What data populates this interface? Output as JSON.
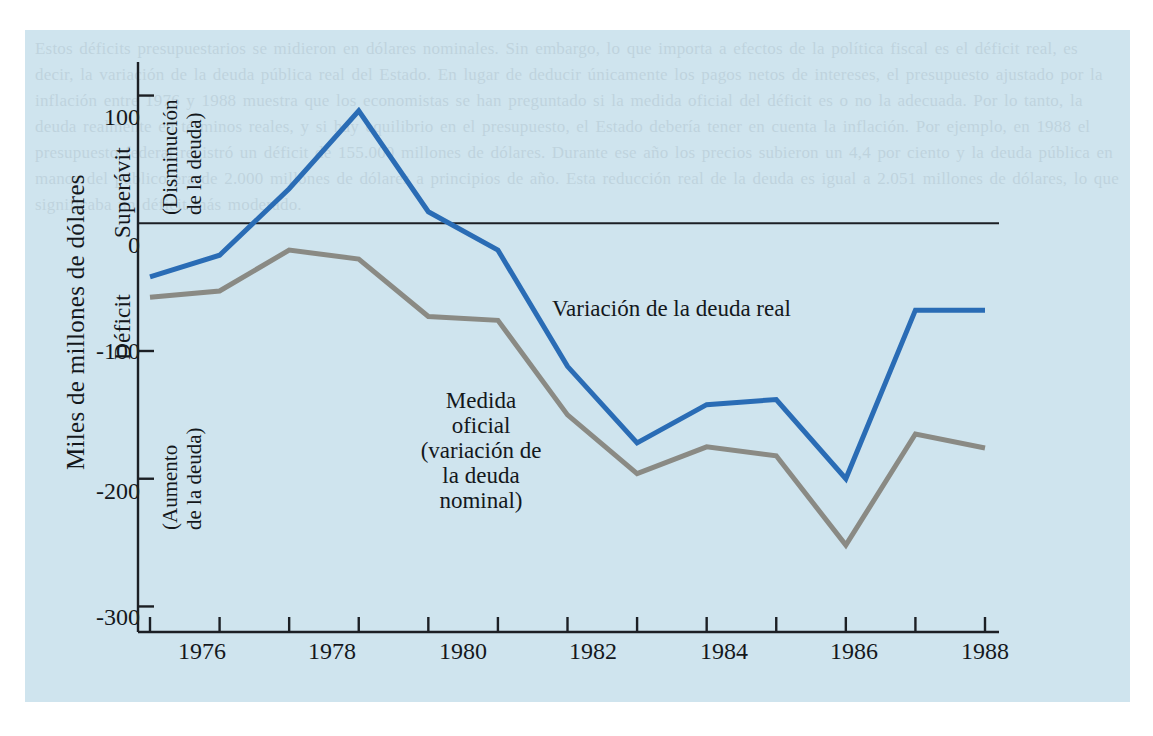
{
  "figure": {
    "background_color": "#ffffff",
    "panel_color": "#cfe4ee",
    "axis_color": "#1c1f24"
  },
  "axes": {
    "ylabel_main": "Miles de millones de dólares",
    "ylabel_positive_zone": "Superávit",
    "ylabel_negative_zone": "Déficit",
    "note_positive": "(Disminución\nde la deuda)",
    "note_positive_line1": "(Disminución",
    "note_positive_line2": "de la deuda)",
    "note_negative_line1": "(Aumento",
    "note_negative_line2": "de la deuda)",
    "ytick_labels": [
      "100",
      "0",
      "-100",
      "-200",
      "-300"
    ],
    "xtick_labels": [
      "1976",
      "1978",
      "1980",
      "1982",
      "1984",
      "1986",
      "1988"
    ]
  },
  "labels": {
    "series_real": "Variación de la deuda real",
    "series_official_line1": "Medida",
    "series_official_line2": "oficial",
    "series_official_line3": "(variación de",
    "series_official_line4": "la deuda",
    "series_official_line5": "nominal)"
  },
  "ghost_text": "Estos déficits presupuestarios se midieron en dólares nominales. Sin embargo, lo que importa a efectos de la política fiscal es el déficit real, es decir, la variación de la deuda pública real del Estado. En lugar de deducir únicamente los pagos netos de intereses, el presupuesto ajustado por la inflación entre 1976 y 1988 muestra que los economistas se han preguntado si la medida oficial del déficit es o no la adecuada. Por lo tanto, la deuda realmente en términos reales, y si hay equilibrio en el presupuesto, el Estado debería tener en cuenta la inflación. Por ejemplo, en 1988 el presupuesto federal registró un déficit de 155.000 millones de dólares. Durante ese año los precios subieron un 4,4 por ciento y la deuda pública en manos del público era de 2.000 millones de dólares a principios de año. Esta reducción real de la deuda es igual a 2.051 millones de dólares, lo que significaba un déficit más moderado.",
  "chart_data": {
    "type": "line",
    "title": "",
    "xlabel": "",
    "ylabel": "Miles de millones de dólares",
    "xlim": [
      1976,
      1988
    ],
    "ylim": [
      -320,
      120
    ],
    "yticks": [
      100,
      0,
      -100,
      -200,
      -300
    ],
    "xticks": [
      1976,
      1977,
      1978,
      1979,
      1980,
      1981,
      1982,
      1983,
      1984,
      1985,
      1986,
      1987,
      1988
    ],
    "xtick_labeled": [
      1976,
      1978,
      1980,
      1982,
      1984,
      1986,
      1988
    ],
    "grid": false,
    "legend": "inline-annotations",
    "x": [
      1976,
      1977,
      1978,
      1979,
      1980,
      1981,
      1982,
      1983,
      1984,
      1985,
      1986,
      1987,
      1988
    ],
    "series": [
      {
        "name": "Variación de la deuda real",
        "color": "#2a6cb5",
        "width": 5,
        "values": [
          -42,
          -25,
          27,
          88,
          9,
          -21,
          -112,
          -172,
          -142,
          -138,
          -200,
          -68,
          -68
        ]
      },
      {
        "name": "Medida oficial (variación de la deuda nominal)",
        "color": "#8a8a84",
        "width": 5,
        "values": [
          -58,
          -53,
          -21,
          -28,
          -73,
          -76,
          -150,
          -196,
          -175,
          -182,
          -252,
          -165,
          -176
        ]
      }
    ]
  }
}
